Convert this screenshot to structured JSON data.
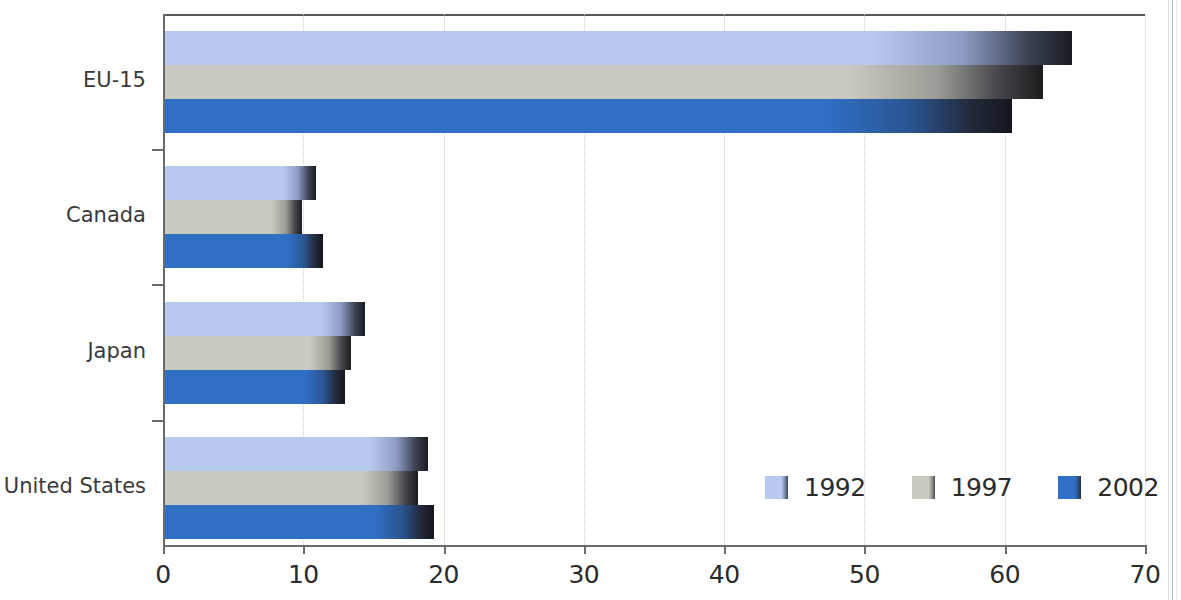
{
  "chart_data": {
    "type": "bar",
    "orientation": "horizontal",
    "title": "",
    "subtitle": "",
    "xlabel": "",
    "ylabel": "",
    "xlim": [
      0,
      70
    ],
    "xticks": [
      0,
      10,
      20,
      30,
      40,
      50,
      60,
      70
    ],
    "xtick_labels": [
      "0",
      "10",
      "20",
      "30",
      "40",
      "50",
      "60",
      "70"
    ],
    "grid": "vertical-dotted",
    "legend_position": "inside-bottom-right",
    "categories": [
      "EU-15",
      "Canada",
      "Japan",
      "United States"
    ],
    "series": [
      {
        "name": "1992",
        "color": "#b8c9ef",
        "values": [
          64.8,
          10.9,
          14.4,
          18.9
        ]
      },
      {
        "name": "1997",
        "color": "#c9c9c1",
        "values": [
          62.7,
          9.9,
          13.4,
          18.2
        ]
      },
      {
        "name": "2002",
        "color": "#2f6fc4",
        "values": [
          60.5,
          11.4,
          13.0,
          19.3
        ]
      }
    ]
  },
  "axis": {
    "line_color": "#6b6b6b",
    "grid_color": "#cfcfcf"
  }
}
